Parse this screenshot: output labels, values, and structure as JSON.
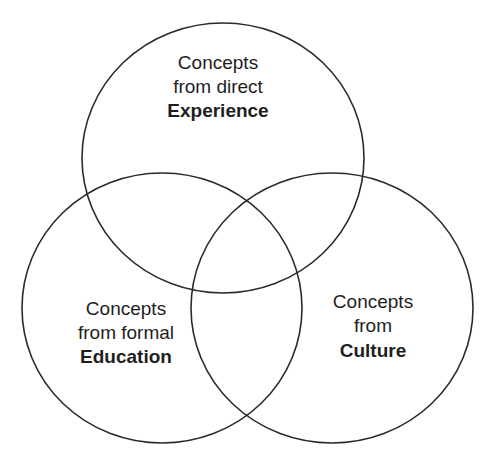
{
  "diagram": {
    "type": "venn",
    "sets": [
      {
        "id": "experience",
        "lines": [
          "Concepts",
          "from direct"
        ],
        "emphasis": "Experience"
      },
      {
        "id": "education",
        "lines": [
          "Concepts",
          "from formal"
        ],
        "emphasis": "Education"
      },
      {
        "id": "culture",
        "lines": [
          "Concepts",
          "from"
        ],
        "emphasis": "Culture"
      }
    ],
    "colors": {
      "stroke": "#2a2a2a",
      "text": "#1e1e1e",
      "background": "#ffffff"
    }
  }
}
